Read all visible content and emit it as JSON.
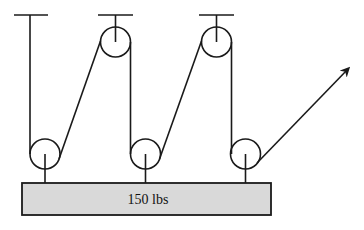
{
  "diagram": {
    "type": "pulley-system",
    "weight_label": "150 lbs",
    "colors": {
      "line": "#1a1a1a",
      "weight_fill": "#d9d9d9",
      "background": "#ffffff"
    },
    "fixed_pulleys": 2,
    "movable_pulleys": 3,
    "ceiling_anchors": 3,
    "pull_direction": "up-right arrow"
  }
}
